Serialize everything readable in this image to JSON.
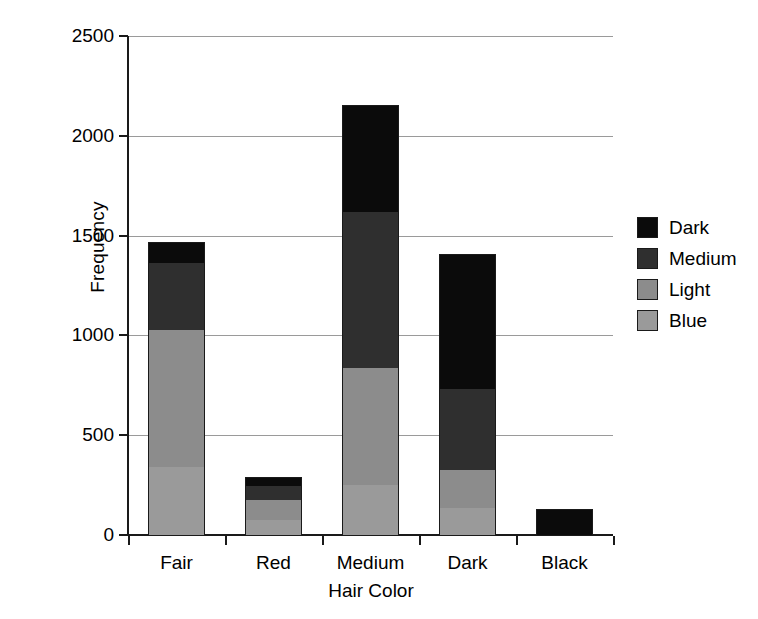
{
  "chart_data": {
    "type": "bar",
    "subtype": "stacked-bar",
    "title": "",
    "xlabel": "Hair Color",
    "ylabel": "Frequency",
    "categories": [
      "Fair",
      "Red",
      "Medium",
      "Dark",
      "Black"
    ],
    "series": [
      {
        "name": "Blue",
        "color": "#9a9a9a",
        "values": [
          340,
          75,
          250,
          135,
          0
        ]
      },
      {
        "name": "Light",
        "color": "#8c8c8c",
        "values": [
          685,
          100,
          585,
          190,
          0
        ]
      },
      {
        "name": "Medium",
        "color": "#2f2f2f",
        "values": [
          340,
          70,
          785,
          405,
          0
        ]
      },
      {
        "name": "Dark",
        "color": "#0b0b0b",
        "values": [
          105,
          45,
          535,
          680,
          130
        ]
      }
    ],
    "stack_order": [
      "Blue",
      "Light",
      "Medium",
      "Dark"
    ],
    "totals": [
      1470,
      290,
      2155,
      1410,
      130
    ],
    "ylim": [
      0,
      2500
    ],
    "yticks": [
      0,
      500,
      1000,
      1500,
      2000,
      2500
    ],
    "ytick_labels": [
      "0",
      "500",
      "1000",
      "1500",
      "2000",
      "2500"
    ],
    "grid": true,
    "grid_axis": "y",
    "legend_position": "right",
    "legend_entries": [
      "Dark",
      "Medium",
      "Light",
      "Blue"
    ],
    "background_color": "#ffffff",
    "axis_color": "#1a1a1a",
    "grid_color": "#9a9a9a"
  },
  "axes": {
    "y_title": "Frequency",
    "x_title": "Hair Color",
    "y_ticks": [
      {
        "label": "2500",
        "value": 2500
      },
      {
        "label": "2000",
        "value": 2000
      },
      {
        "label": "1500",
        "value": 1500
      },
      {
        "label": "1000",
        "value": 1000
      },
      {
        "label": "500",
        "value": 500
      },
      {
        "label": "0",
        "value": 0
      }
    ],
    "x_ticks": [
      {
        "label": "Fair"
      },
      {
        "label": "Red"
      },
      {
        "label": "Medium"
      },
      {
        "label": "Dark"
      },
      {
        "label": "Black"
      }
    ]
  },
  "legend": {
    "items": [
      {
        "label": "Dark",
        "color": "#0b0b0b"
      },
      {
        "label": "Medium",
        "color": "#2f2f2f"
      },
      {
        "label": "Light",
        "color": "#8c8c8c"
      },
      {
        "label": "Blue",
        "color": "#9a9a9a"
      }
    ]
  }
}
